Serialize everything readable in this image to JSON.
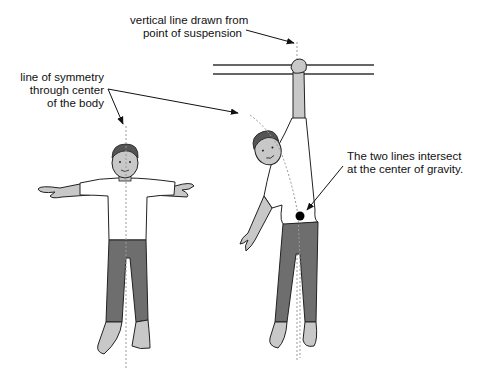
{
  "labels": {
    "vertical_line": [
      "vertical line drawn from",
      "point of suspension"
    ],
    "symmetry_line": [
      "line of symmetry",
      "through center",
      "of the body"
    ],
    "intersection": [
      "The two lines intersect",
      "at the center of gravity."
    ]
  },
  "figures": {
    "standing_figure": "person standing with arms outstretched",
    "hanging_figure": "person hanging from bar by one hand"
  },
  "colors": {
    "skin": "#c8c8c8",
    "pants": "#6e6e6e",
    "hair": "#555555",
    "shirt": "#ffffff",
    "outline": "#222222",
    "guide_line": "#999999",
    "cog_dot": "#000000"
  }
}
